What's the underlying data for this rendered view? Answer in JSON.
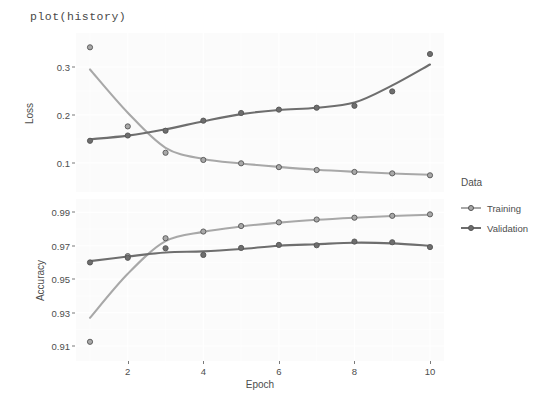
{
  "title": "plot(history)",
  "legend": {
    "title": "Data",
    "items": [
      {
        "label": "Training",
        "color": "#a8a8a8"
      },
      {
        "label": "Validation",
        "color": "#6e6e6e"
      }
    ]
  },
  "axes": {
    "xlabel": "Epoch",
    "xticks": [
      "2",
      "4",
      "6",
      "8",
      "10"
    ],
    "loss_ylabel": "Loss",
    "loss_yticks": [
      "0.1",
      "0.2",
      "0.3"
    ],
    "accuracy_ylabel": "Accuracy",
    "accuracy_yticks": [
      "0.91",
      "0.93",
      "0.95",
      "0.97",
      "0.99"
    ]
  },
  "chart_data": [
    {
      "type": "line",
      "title": "Loss",
      "xlabel": "Epoch",
      "ylabel": "Loss",
      "x": [
        1,
        2,
        3,
        4,
        5,
        6,
        7,
        8,
        9,
        10
      ],
      "xlim": [
        1,
        10
      ],
      "ylim": [
        0.06,
        0.35
      ],
      "grid": true,
      "legend_position": "right",
      "series": [
        {
          "name": "Training",
          "color": "#a8a8a8",
          "values": [
            0.341,
            0.176,
            0.121,
            0.106,
            0.099,
            0.091,
            0.085,
            0.081,
            0.078,
            0.074
          ]
        },
        {
          "name": "Validation",
          "color": "#6e6e6e",
          "values": [
            0.146,
            0.157,
            0.167,
            0.188,
            0.204,
            0.211,
            0.215,
            0.219,
            0.249,
            0.327
          ]
        }
      ]
    },
    {
      "type": "line",
      "title": "Accuracy",
      "xlabel": "Epoch",
      "ylabel": "Accuracy",
      "x": [
        1,
        2,
        3,
        4,
        5,
        6,
        7,
        8,
        9,
        10
      ],
      "xlim": [
        1,
        10
      ],
      "ylim": [
        0.907,
        0.992
      ],
      "grid": true,
      "legend_position": "right",
      "series": [
        {
          "name": "Training",
          "color": "#a8a8a8",
          "values": [
            0.9125,
            0.9638,
            0.9745,
            0.9785,
            0.9818,
            0.984,
            0.9857,
            0.9868,
            0.9879,
            0.9888
          ]
        },
        {
          "name": "Validation",
          "color": "#6e6e6e",
          "values": [
            0.96,
            0.9628,
            0.9685,
            0.9645,
            0.9687,
            0.9705,
            0.9703,
            0.9725,
            0.9721,
            0.9692
          ]
        }
      ]
    }
  ]
}
